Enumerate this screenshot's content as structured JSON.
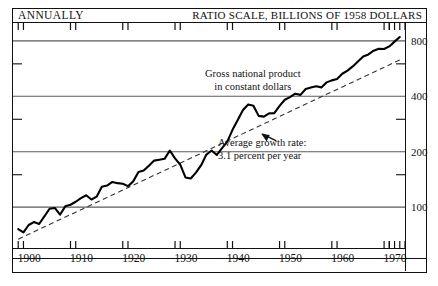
{
  "header": {
    "left_label": "ANNUALLY",
    "right_label": "RATIO SCALE, BILLIONS OF 1958 DOLLARS"
  },
  "annotations": {
    "series_label_line1": "Gross national product",
    "series_label_line2": "in constant dollars",
    "growth_line1": "Average growth rate:",
    "growth_line2": "3.1 percent per year"
  },
  "colors": {
    "ink": "#111111",
    "grid": "#5a5a5a",
    "series": "#000000",
    "trend": "#333333"
  },
  "chart_data": {
    "type": "line",
    "title": "Gross national product in constant dollars",
    "subtitle": "RATIO SCALE, BILLIONS OF 1958 DOLLARS",
    "frequency": "ANNUALLY",
    "xlabel": "",
    "ylabel": "Billions of 1958 dollars",
    "scale": "log",
    "grid": true,
    "legend_position": "none",
    "xlim": [
      1899,
      1974
    ],
    "ylim": [
      60,
      1000
    ],
    "ytick_labels": [
      "100",
      "200",
      "400",
      "800"
    ],
    "ytick_values": [
      100,
      200,
      400,
      800
    ],
    "xtick_labels": [
      "1900",
      "1910",
      "1920",
      "1930",
      "1940",
      "1950",
      "1960",
      "1970"
    ],
    "xtick_values": [
      1900,
      1910,
      1920,
      1930,
      1940,
      1950,
      1960,
      1970
    ],
    "series": [
      {
        "name": "Gross national product in constant dollars",
        "style": "solid",
        "x": [
          1900,
          1901,
          1902,
          1903,
          1904,
          1905,
          1906,
          1907,
          1908,
          1909,
          1910,
          1911,
          1912,
          1913,
          1914,
          1915,
          1916,
          1917,
          1918,
          1919,
          1920,
          1921,
          1922,
          1923,
          1924,
          1925,
          1926,
          1927,
          1928,
          1929,
          1930,
          1931,
          1932,
          1933,
          1934,
          1935,
          1936,
          1937,
          1938,
          1939,
          1940,
          1941,
          1942,
          1943,
          1944,
          1945,
          1946,
          1947,
          1948,
          1949,
          1950,
          1951,
          1952,
          1953,
          1954,
          1955,
          1956,
          1957,
          1958,
          1959,
          1960,
          1961,
          1962,
          1963,
          1964,
          1965,
          1966,
          1967,
          1968,
          1969,
          1970,
          1971,
          1972,
          1973
        ],
        "values": [
          76,
          73,
          80,
          83,
          81,
          89,
          98,
          99,
          91,
          101,
          103,
          107,
          112,
          116,
          110,
          114,
          129,
          131,
          137,
          135,
          134,
          130,
          138,
          155,
          158,
          168,
          179,
          181,
          183,
          203,
          184,
          170,
          145,
          143,
          154,
          169,
          193,
          203,
          192,
          209,
          227,
          263,
          297,
          337,
          361,
          355,
          313,
          310,
          323,
          324,
          355,
          383,
          396,
          413,
          407,
          438,
          446,
          453,
          447,
          476,
          488,
          497,
          530,
          551,
          581,
          618,
          658,
          675,
          707,
          725,
          722,
          746,
          792,
          839
        ]
      },
      {
        "name": "Average growth rate: 3.1 percent per year",
        "style": "dashed",
        "x": [
          1900,
          1973
        ],
        "values": [
          67,
          630
        ]
      }
    ]
  }
}
